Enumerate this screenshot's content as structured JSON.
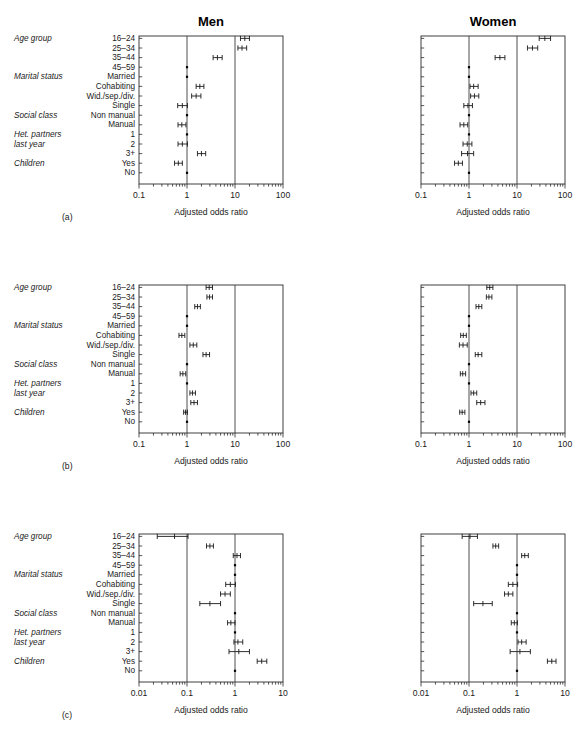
{
  "figure": {
    "column_titles": [
      "Men",
      "Women"
    ],
    "panel_labels": [
      "(a)",
      "(b)",
      "(c)"
    ],
    "axis_label": "Adjusted odds ratio",
    "row_groups": [
      {
        "group": "Age group",
        "levels": [
          "16–24",
          "25–34",
          "35–44",
          "45–59"
        ]
      },
      {
        "group": "Marital status",
        "levels": [
          "Married",
          "Cohabiting",
          "Wid./sep./div.",
          "Single"
        ]
      },
      {
        "group": "Social class",
        "levels": [
          "Non manual",
          "Manual"
        ]
      },
      {
        "group": "Het. partners last year",
        "group_line1": "Het. partners",
        "group_line2": "last year",
        "levels": [
          "1",
          "2",
          "3+"
        ]
      },
      {
        "group": "Children",
        "levels": [
          "Yes",
          "No"
        ]
      }
    ],
    "colors": {
      "axis": "#2b2b2b",
      "marker": "#000000",
      "reference_line": "#3a3a3a",
      "background": "#ffffff"
    }
  },
  "chart_data": [
    {
      "type": "scatter",
      "panel": "(a)",
      "subpanel": "Men",
      "title": "Men",
      "xlabel": "Adjusted odds ratio",
      "ylabel": "",
      "xscale": "log",
      "xlim": [
        0.1,
        100
      ],
      "xticks": [
        0.1,
        1,
        10,
        100
      ],
      "xticklabels": [
        "0.1",
        "1",
        "10",
        "100"
      ],
      "reference_lines": [
        1,
        10
      ],
      "grid": false,
      "categories": [
        "16–24",
        "25–34",
        "35–44",
        "45–59",
        "Married",
        "Cohabiting",
        "Wid./sep./div.",
        "Single",
        "Non manual",
        "Manual",
        "1",
        "2",
        "3+",
        "Yes",
        "No"
      ],
      "values": [
        16.0,
        14.0,
        4.3,
        1.0,
        1.0,
        1.85,
        1.55,
        0.8,
        1.0,
        0.78,
        1.0,
        0.8,
        2.0,
        0.66,
        1.0
      ],
      "ci_low": [
        13.0,
        11.5,
        3.5,
        null,
        null,
        1.55,
        1.25,
        0.64,
        null,
        0.65,
        null,
        0.65,
        1.65,
        0.55,
        null
      ],
      "ci_high": [
        20.0,
        17.5,
        5.4,
        null,
        null,
        2.25,
        1.95,
        1.02,
        null,
        0.95,
        null,
        1.02,
        2.45,
        0.8,
        null
      ],
      "reference_rows": [
        "45–59",
        "Married",
        "Non manual",
        "1",
        "No"
      ]
    },
    {
      "type": "scatter",
      "panel": "(a)",
      "subpanel": "Women",
      "title": "Women",
      "xlabel": "Adjusted odds ratio",
      "ylabel": "",
      "xscale": "log",
      "xlim": [
        0.1,
        100
      ],
      "xticks": [
        0.1,
        1,
        10,
        100
      ],
      "xticklabels": [
        "0.1",
        "1",
        "10",
        "100"
      ],
      "reference_lines": [
        1,
        10
      ],
      "grid": false,
      "categories": [
        "16–24",
        "25–34",
        "35–44",
        "45–59",
        "Married",
        "Cohabiting",
        "Wid./sep./div.",
        "Single",
        "Non manual",
        "Manual",
        "1",
        "2",
        "3+",
        "Yes",
        "No"
      ],
      "values": [
        38.0,
        21.0,
        4.4,
        1.0,
        1.0,
        1.25,
        1.3,
        0.95,
        1.0,
        0.78,
        1.0,
        0.92,
        0.93,
        0.6,
        1.0
      ],
      "ci_low": [
        29.0,
        16.5,
        3.5,
        null,
        null,
        1.05,
        1.08,
        0.78,
        null,
        0.65,
        null,
        0.75,
        0.7,
        0.5,
        null
      ],
      "ci_high": [
        50.0,
        27.0,
        5.6,
        null,
        null,
        1.55,
        1.6,
        1.18,
        null,
        0.94,
        null,
        1.15,
        1.25,
        0.73,
        null
      ],
      "reference_rows": [
        "45–59",
        "Married",
        "Non manual",
        "1",
        "No"
      ]
    },
    {
      "type": "scatter",
      "panel": "(b)",
      "subpanel": "Men",
      "title": "",
      "xlabel": "Adjusted odds ratio",
      "ylabel": "",
      "xscale": "log",
      "xlim": [
        0.1,
        100
      ],
      "xticks": [
        0.1,
        1,
        10,
        100
      ],
      "xticklabels": [
        "0.1",
        "1",
        "10",
        "100"
      ],
      "reference_lines": [
        1,
        10
      ],
      "grid": false,
      "categories": [
        "16–24",
        "25–34",
        "35–44",
        "45–59",
        "Married",
        "Cohabiting",
        "Wid./sep./div.",
        "Single",
        "Non manual",
        "Manual",
        "1",
        "2",
        "3+",
        "Yes",
        "No"
      ],
      "values": [
        2.9,
        2.95,
        1.65,
        1.0,
        1.0,
        0.78,
        1.35,
        2.5,
        1.0,
        0.82,
        1.0,
        1.3,
        1.4,
        0.93,
        1.0
      ],
      "ci_low": [
        2.5,
        2.6,
        1.45,
        null,
        null,
        0.68,
        1.15,
        2.15,
        null,
        0.72,
        null,
        1.15,
        1.2,
        0.85,
        null
      ],
      "ci_high": [
        3.4,
        3.4,
        1.9,
        null,
        null,
        0.9,
        1.6,
        2.95,
        null,
        0.94,
        null,
        1.5,
        1.65,
        1.02,
        null
      ],
      "reference_rows": [
        "45–59",
        "Married",
        "Non manual",
        "1",
        "No"
      ]
    },
    {
      "type": "scatter",
      "panel": "(b)",
      "subpanel": "Women",
      "title": "",
      "xlabel": "Adjusted odds ratio",
      "ylabel": "",
      "xscale": "log",
      "xlim": [
        0.1,
        100
      ],
      "xticks": [
        0.1,
        1,
        10,
        100
      ],
      "xticklabels": [
        "0.1",
        "1",
        "10",
        "100"
      ],
      "reference_lines": [
        1,
        10
      ],
      "grid": false,
      "categories": [
        "16–24",
        "25–34",
        "35–44",
        "45–59",
        "Married",
        "Cohabiting",
        "Wid./sep./div.",
        "Single",
        "Non manual",
        "Manual",
        "1",
        "2",
        "3+",
        "Yes",
        "No"
      ],
      "values": [
        2.7,
        2.6,
        1.6,
        1.0,
        1.0,
        0.76,
        0.75,
        1.55,
        1.0,
        0.74,
        1.0,
        1.25,
        1.75,
        0.72,
        1.0
      ],
      "ci_low": [
        2.35,
        2.3,
        1.4,
        null,
        null,
        0.67,
        0.63,
        1.35,
        null,
        0.66,
        null,
        1.1,
        1.45,
        0.64,
        null
      ],
      "ci_high": [
        3.15,
        3.0,
        1.85,
        null,
        null,
        0.88,
        0.92,
        1.85,
        null,
        0.85,
        null,
        1.45,
        2.15,
        0.82,
        null
      ],
      "reference_rows": [
        "45–59",
        "Married",
        "Non manual",
        "1",
        "No"
      ]
    },
    {
      "type": "scatter",
      "panel": "(c)",
      "subpanel": "Men",
      "title": "",
      "xlabel": "Adjusted odds ratio",
      "ylabel": "",
      "xscale": "log",
      "xlim": [
        0.01,
        10
      ],
      "xticks": [
        0.01,
        0.1,
        1,
        10
      ],
      "xticklabels": [
        "0.01",
        "0.1",
        "1",
        "10"
      ],
      "reference_lines": [
        0.1,
        1
      ],
      "grid": false,
      "categories": [
        "16–24",
        "25–34",
        "35–44",
        "45–59",
        "Married",
        "Cohabiting",
        "Wid./sep./div.",
        "Single",
        "Non manual",
        "Manual",
        "1",
        "2",
        "3+",
        "Yes",
        "No"
      ],
      "values": [
        0.055,
        0.3,
        1.1,
        1.0,
        1.0,
        0.8,
        0.62,
        0.3,
        1.0,
        0.82,
        1.0,
        1.15,
        1.2,
        3.6,
        1.0
      ],
      "ci_low": [
        0.024,
        0.255,
        0.92,
        null,
        null,
        0.64,
        0.5,
        0.185,
        null,
        0.7,
        null,
        0.95,
        0.75,
        2.9,
        null
      ],
      "ci_high": [
        0.105,
        0.355,
        1.3,
        null,
        null,
        1.02,
        0.8,
        0.5,
        null,
        1.0,
        null,
        1.45,
        2.0,
        4.6,
        null
      ],
      "reference_rows": [
        "45–59",
        "Married",
        "Non manual",
        "1",
        "No"
      ]
    },
    {
      "type": "scatter",
      "panel": "(c)",
      "subpanel": "Women",
      "title": "",
      "xlabel": "Adjusted odds ratio",
      "ylabel": "",
      "xscale": "log",
      "xlim": [
        0.01,
        10
      ],
      "xticks": [
        0.01,
        0.1,
        1,
        10
      ],
      "xticklabels": [
        "0.01",
        "0.1",
        "1",
        "10"
      ],
      "reference_lines": [
        0.1,
        1
      ],
      "grid": false,
      "categories": [
        "16–24",
        "25–34",
        "35–44",
        "45–59",
        "Married",
        "Cohabiting",
        "Wid./sep./div.",
        "Single",
        "Non manual",
        "Manual",
        "1",
        "2",
        "3+",
        "Yes",
        "No"
      ],
      "values": [
        0.105,
        0.36,
        1.45,
        1.0,
        1.0,
        0.82,
        0.66,
        0.195,
        1.0,
        0.88,
        1.0,
        1.25,
        1.15,
        5.3,
        1.0
      ],
      "ci_low": [
        0.072,
        0.315,
        1.25,
        null,
        null,
        0.66,
        0.55,
        0.125,
        null,
        0.76,
        null,
        1.05,
        0.72,
        4.3,
        null
      ],
      "ci_high": [
        0.15,
        0.415,
        1.72,
        null,
        null,
        1.03,
        0.82,
        0.305,
        null,
        1.02,
        null,
        1.55,
        1.9,
        6.5,
        null
      ],
      "reference_rows": [
        "45–59",
        "Married",
        "Non manual",
        "1",
        "No"
      ]
    }
  ]
}
